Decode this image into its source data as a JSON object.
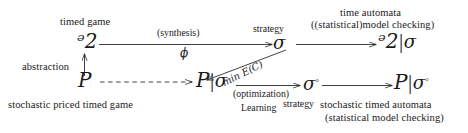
{
  "figure": {
    "type": "commutative-diagram",
    "background": "#ffffff",
    "ink": "#1a1a1a",
    "nodes": {
      "g": "ᵊ2",
      "g_label": "G",
      "p_label": "P",
      "sigma": "σ",
      "sigma_circ_sup": "◦",
      "bar": "|"
    },
    "captions": {
      "timed_game": "timed game",
      "time_automata": "time automata",
      "model_checking": "((statistical)model checking)",
      "abstraction": "abstraction",
      "stochastic_priced_timed_game": "stochastic priced timed game",
      "stochastic_timed_automata": "stochastic timed automata",
      "statistical_model_checking": "(statistical model checking)"
    },
    "arrow_labels": {
      "synthesis": "(synthesis)",
      "phi": "ϕ",
      "strategy_top": "strategy",
      "min_expected_cost": "min E(C)",
      "optimization": "(optimization)",
      "learning": "Learning",
      "strategy_bottom": "strategy"
    }
  }
}
